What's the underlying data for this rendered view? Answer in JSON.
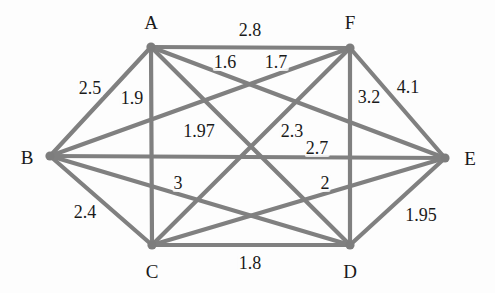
{
  "figure": {
    "kind": "weighted-undirected-graph",
    "width": 495,
    "height": 293,
    "background_color": "#fdfdfd",
    "edge_color": "#808080",
    "node_color": "#7d7d7d",
    "label_color": "#1a1a1a"
  },
  "nodes": [
    {
      "id": "A",
      "label": "A",
      "cx": 151,
      "cy": 47,
      "r": 4.6,
      "label_x": 151,
      "label_y": 22
    },
    {
      "id": "B",
      "label": "B",
      "cx": 50,
      "cy": 156,
      "r": 4.6,
      "label_x": 27,
      "label_y": 157
    },
    {
      "id": "C",
      "label": "C",
      "cx": 152,
      "cy": 245,
      "r": 4.6,
      "label_x": 152,
      "label_y": 271
    },
    {
      "id": "D",
      "label": "D",
      "cx": 350,
      "cy": 245,
      "r": 4.6,
      "label_x": 350,
      "label_y": 271
    },
    {
      "id": "E",
      "label": "E",
      "cx": 445,
      "cy": 158,
      "r": 4.6,
      "label_x": 470,
      "label_y": 158
    },
    {
      "id": "F",
      "label": "F",
      "cx": 350,
      "cy": 48,
      "r": 4.6,
      "label_x": 350,
      "label_y": 22
    }
  ],
  "edges": [
    {
      "id": "A-F",
      "from": "A",
      "to": "F",
      "weight": "2.8",
      "label_x": 250,
      "label_y": 30
    },
    {
      "id": "A-B",
      "from": "A",
      "to": "B",
      "weight": "2.5",
      "label_x": 90,
      "label_y": 88
    },
    {
      "id": "A-C",
      "from": "A",
      "to": "C",
      "weight": "1.9",
      "label_x": 132,
      "label_y": 98
    },
    {
      "id": "B-F",
      "from": "B",
      "to": "F",
      "weight": "1.6",
      "label_x": 225,
      "label_y": 62
    },
    {
      "id": "A-E",
      "from": "A",
      "to": "E",
      "weight": "1.7",
      "label_x": 276,
      "label_y": 62
    },
    {
      "id": "F-D",
      "from": "F",
      "to": "D",
      "weight": "3.2",
      "label_x": 369,
      "label_y": 97
    },
    {
      "id": "F-E",
      "from": "F",
      "to": "E",
      "weight": "4.1",
      "label_x": 408,
      "label_y": 87
    },
    {
      "id": "A-D",
      "from": "A",
      "to": "D",
      "weight": "1.97",
      "label_x": 199,
      "label_y": 131
    },
    {
      "id": "C-F",
      "from": "C",
      "to": "F",
      "weight": "2.3",
      "label_x": 292,
      "label_y": 131
    },
    {
      "id": "B-E",
      "from": "B",
      "to": "E",
      "weight": "2.7",
      "label_x": 317,
      "label_y": 148
    },
    {
      "id": "B-D",
      "from": "B",
      "to": "D",
      "weight": "3",
      "label_x": 178,
      "label_y": 183
    },
    {
      "id": "C-E",
      "from": "C",
      "to": "E",
      "weight": "2",
      "label_x": 325,
      "label_y": 183
    },
    {
      "id": "B-C",
      "from": "B",
      "to": "C",
      "weight": "2.4",
      "label_x": 85,
      "label_y": 212
    },
    {
      "id": "C-D",
      "from": "C",
      "to": "D",
      "weight": "1.8",
      "label_x": 250,
      "label_y": 263
    },
    {
      "id": "D-E",
      "from": "D",
      "to": "E",
      "weight": "1.95",
      "label_x": 421,
      "label_y": 215
    }
  ]
}
